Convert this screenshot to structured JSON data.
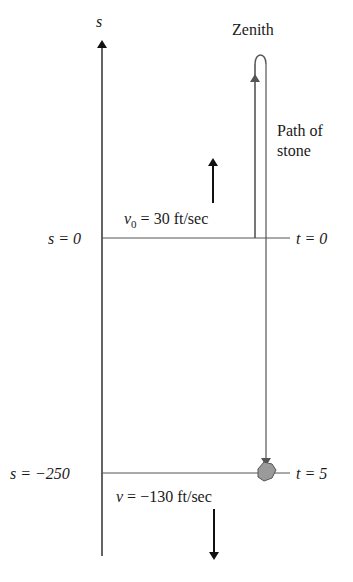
{
  "diagram": {
    "axis_label": "s",
    "zenith_label": "Zenith",
    "path_label_line1": "Path of",
    "path_label_line2": "stone",
    "top_level": {
      "s_label": "s = 0",
      "t_label": "t = 0",
      "velocity_label": "v",
      "velocity_sub": "0",
      "velocity_value": " = 30 ft/sec"
    },
    "bottom_level": {
      "s_label": "s = −250",
      "t_label": "t = 5",
      "velocity_label": "v",
      "velocity_value": " = −130 ft/sec"
    },
    "colors": {
      "line": "#3a3a3a",
      "path": "#555555",
      "stone_fill": "#9a9a9a",
      "stone_stroke": "#555555"
    }
  }
}
